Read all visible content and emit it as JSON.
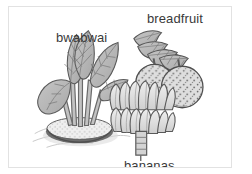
{
  "image": {
    "type": "line-drawing-illustration",
    "subject": "Three Pacific island food plants: taro (bwabwai), breadfruit and bananas",
    "style": "greyscale pen-and-ink illustration with stippled shading",
    "background_color": "#ffffff",
    "border_color": "#e2e2e2",
    "ink_color": "#4a4a4a",
    "label_color": "#3a3a3a"
  },
  "labels": {
    "taro": "bwabwai",
    "breadfruit": "breadfruit",
    "bananas": "bananas"
  },
  "plants": [
    {
      "name": "bwabwai",
      "description": "Taro plant with broad heart-shaped leaves on long stalks growing from a stippled oval mound surrounded by water ripples",
      "position": "left",
      "leaf_count": 5,
      "fill_color": "#b9b9b9",
      "outline_color": "#555555"
    },
    {
      "name": "breadfruit",
      "description": "Two round stippled breadfruits hanging from a branch with lobed leaves",
      "position": "top-right",
      "fruit_count": 2,
      "leaf_count": 4,
      "fill_color": "#dcdcdc",
      "outline_color": "#4f4f4f"
    },
    {
      "name": "bananas",
      "description": "Banana bunch with two tiers of fingers above a banded stem",
      "position": "bottom-center",
      "tier_count": 2,
      "finger_count": 15,
      "fill_color": "#e3e3e3",
      "outline_color": "#5a5a5a"
    }
  ]
}
